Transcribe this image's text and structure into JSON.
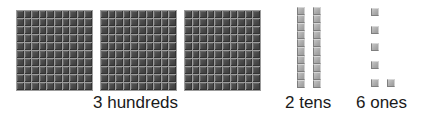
{
  "diagram": {
    "type": "base-ten-blocks",
    "number_represented": 326,
    "groups": [
      {
        "name": "hundreds",
        "count": 3,
        "label": "3 hundreds",
        "block": "flat-10x10"
      },
      {
        "name": "tens",
        "count": 2,
        "label": "2 tens",
        "block": "rod-1x10"
      },
      {
        "name": "ones",
        "count": 6,
        "label": "6 ones",
        "block": "unit-cube"
      }
    ]
  },
  "labels": {
    "hundreds": "3 hundreds",
    "tens": "2 tens",
    "ones": "6 ones"
  },
  "colors": {
    "flat_cell": "#4a4a4a",
    "flat_grid": "#9c9c9c",
    "unit_cube": "#a8a8a8",
    "label_text": "#1a1a1a"
  }
}
